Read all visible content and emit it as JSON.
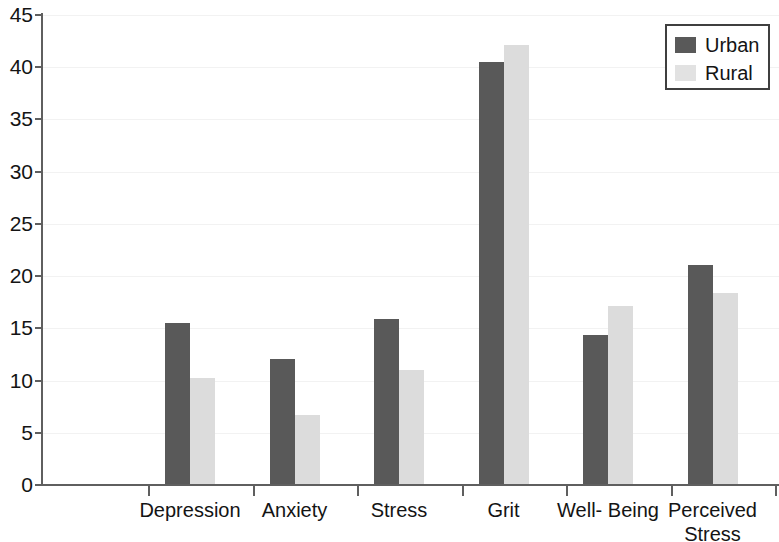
{
  "chart_data": {
    "type": "bar",
    "title": "",
    "subtitle": "",
    "xlabel": "",
    "ylabel": "",
    "ylim": [
      0,
      45
    ],
    "ytick_step": 5,
    "yticks": [
      "45",
      "40",
      "35",
      "30",
      "25",
      "20",
      "15",
      "10",
      "5",
      "0"
    ],
    "ytick_values": [
      45,
      40,
      35,
      30,
      25,
      20,
      15,
      10,
      5,
      0
    ],
    "grid": "horizontal",
    "legend_position": "top-right",
    "categories": [
      "Depression",
      "Anxiety",
      "Stress",
      "Grit",
      "Well- Being",
      "Perceived\nStress"
    ],
    "series": [
      {
        "name": "Urban",
        "color": "#595959",
        "values": [
          15.5,
          12.1,
          15.9,
          40.5,
          14.4,
          21.1
        ]
      },
      {
        "name": "Rural",
        "color": "#dcdcdc",
        "values": [
          10.2,
          6.7,
          11.0,
          42.1,
          17.1,
          18.4
        ]
      }
    ]
  },
  "legend": {
    "items": [
      {
        "label": "Urban",
        "swatch": "urban"
      },
      {
        "label": "Rural",
        "swatch": "rural"
      }
    ]
  }
}
